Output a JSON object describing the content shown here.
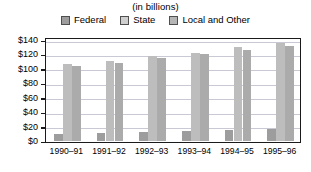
{
  "subtitle": "(in billions)",
  "legend": {
    "items": [
      {
        "label": "Federal",
        "color": "#9d9d9d",
        "icon": "legend-swatch-icon"
      },
      {
        "label": "State",
        "color": "#bdbdbd",
        "icon": "legend-swatch-icon"
      },
      {
        "label": "Local and Other",
        "color": "#ababab",
        "icon": "legend-swatch-icon"
      }
    ]
  },
  "axes": {
    "y_ticks": [
      "$140",
      "$120",
      "$100",
      "$80",
      "$60",
      "$40",
      "$20",
      "$0"
    ],
    "x_ticks": [
      "1990–91",
      "1991–92",
      "1992–93",
      "1993–94",
      "1994–95",
      "1995–96"
    ]
  },
  "chart_data": {
    "type": "bar",
    "title": "",
    "subtitle": "(in billions)",
    "xlabel": "",
    "ylabel": "",
    "ylim": [
      0,
      140
    ],
    "ytick_step": 20,
    "grid": true,
    "legend_position": "top",
    "categories": [
      "1990–91",
      "1991–92",
      "1992–93",
      "1993–94",
      "1994–95",
      "1995–96"
    ],
    "series": [
      {
        "name": "Federal",
        "color": "#9d9d9d",
        "values": [
          9,
          11,
          12,
          13,
          15,
          16
        ]
      },
      {
        "name": "State",
        "color": "#bdbdbd",
        "values": [
          106,
          110,
          117,
          122,
          129,
          135
        ]
      },
      {
        "name": "Local and Other",
        "color": "#ababab",
        "values": [
          103,
          107,
          114,
          120,
          126,
          131
        ]
      }
    ]
  }
}
